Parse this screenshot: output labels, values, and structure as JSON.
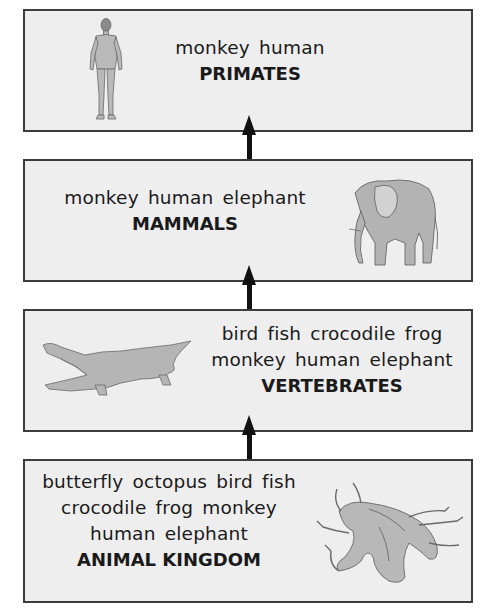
{
  "diagram": {
    "type": "classification-hierarchy",
    "levels": [
      {
        "id": "primates",
        "members_lines": [
          "monkey  human"
        ],
        "title": "PRIMATES",
        "illustration": "human-figure-icon"
      },
      {
        "id": "mammals",
        "members_lines": [
          "monkey  human  elephant"
        ],
        "title": "MAMMALS",
        "illustration": "elephant-icon"
      },
      {
        "id": "vertebrates",
        "members_lines": [
          "bird  fish  crocodile  frog",
          "monkey  human  elephant"
        ],
        "title": "VERTEBRATES",
        "illustration": "crocodile-icon"
      },
      {
        "id": "animal-kingdom",
        "members_lines": [
          "butterfly  octopus  bird  fish",
          "crocodile  frog  monkey",
          "human  elephant"
        ],
        "title": "ANIMAL KINGDOM",
        "illustration": "octopus-icon"
      }
    ],
    "arrows": [
      {
        "from": "animal-kingdom",
        "to": "vertebrates",
        "direction": "up"
      },
      {
        "from": "vertebrates",
        "to": "mammals",
        "direction": "up"
      },
      {
        "from": "mammals",
        "to": "primates",
        "direction": "up"
      }
    ],
    "colors": {
      "box_fill": "#eeeeee",
      "box_border": "#3c3c3c",
      "arrow": "#111111",
      "text": "#1a1a1a"
    }
  }
}
